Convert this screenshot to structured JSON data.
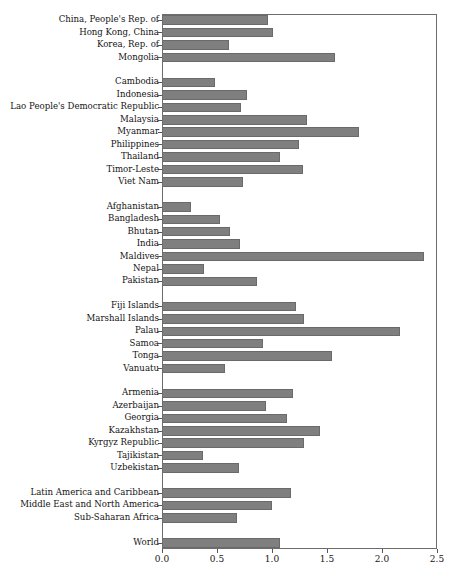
{
  "chart_data": {
    "type": "bar",
    "orientation": "horizontal",
    "title": "",
    "xlabel": "",
    "ylabel": "",
    "xlim": [
      0.0,
      2.5
    ],
    "xticks": [
      "0.0",
      "0.5",
      "1.0",
      "1.5",
      "2.0",
      "2.5"
    ],
    "xtick_values": [
      0.0,
      0.5,
      1.0,
      1.5,
      2.0,
      2.5
    ],
    "grid": false,
    "legend": "none",
    "bar_color": "#7f7f7f",
    "categories": [
      "China, People's Rep. of",
      "Hong Kong, China",
      "Korea, Rep. of",
      "Mongolia",
      "",
      "Cambodia",
      "Indonesia",
      "Lao People's Democratic Republic",
      "Malaysia",
      "Myanmar",
      "Philippines",
      "Thailand",
      "Timor-Leste",
      "Viet Nam",
      "",
      "Afghanistan",
      "Bangladesh",
      "Bhutan",
      "India",
      "Maldives",
      "Nepal",
      "Pakistan",
      "",
      "Fiji Islands",
      "Marshall Islands",
      "Palau",
      "Samoa",
      "Tonga",
      "Vanuatu",
      "",
      "Armenia",
      "Azerbaijan",
      "Georgia",
      "Kazakhstan",
      "Kyrgyz Republic",
      "Tajikistan",
      "Uzbekistan",
      "",
      "Latin America and Caribbean",
      "Middle East and North America",
      "Sub-Saharan Africa",
      "",
      "World"
    ],
    "values": [
      0.95,
      1.0,
      0.6,
      1.56,
      null,
      0.47,
      0.76,
      0.71,
      1.31,
      1.78,
      1.24,
      1.06,
      1.27,
      0.73,
      null,
      0.25,
      0.52,
      0.61,
      0.7,
      2.37,
      0.37,
      0.85,
      null,
      1.21,
      1.28,
      2.15,
      0.91,
      1.54,
      0.56,
      null,
      1.18,
      0.94,
      1.13,
      1.43,
      1.28,
      0.36,
      0.69,
      null,
      1.16,
      0.99,
      0.67,
      null,
      1.06
    ]
  }
}
